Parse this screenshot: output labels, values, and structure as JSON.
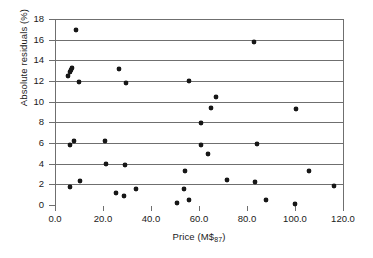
{
  "chart_data": {
    "type": "scatter",
    "title": "",
    "xlabel": "Price (M$87)",
    "xlabel_base": "Price (M$",
    "xlabel_sub": "87",
    "xlabel_tail": ")",
    "ylabel": "Absolute residuals (%)",
    "xlim": [
      0,
      120
    ],
    "ylim": [
      0,
      18
    ],
    "xticks": [
      0,
      20,
      40,
      60,
      80,
      100,
      120
    ],
    "xtick_labels": [
      "0.0",
      "20.0",
      "40.0",
      "60.0",
      "80.0",
      "100.0",
      "120.0"
    ],
    "yticks": [
      0,
      2,
      4,
      6,
      8,
      10,
      12,
      14,
      16,
      18
    ],
    "ytick_labels": [
      "0",
      "2",
      "4",
      "6",
      "8",
      "10",
      "12",
      "14",
      "16",
      "18"
    ],
    "grid": "horizontal",
    "grid_color": "#6f6f6f",
    "marker_color": "#171717",
    "legend": "none",
    "points": [
      {
        "x": 5.5,
        "y": 12.5
      },
      {
        "x": 6.3,
        "y": 12.9
      },
      {
        "x": 6.8,
        "y": 13.1
      },
      {
        "x": 7.2,
        "y": 13.25
      },
      {
        "x": 6.2,
        "y": 5.8
      },
      {
        "x": 6.4,
        "y": 1.7
      },
      {
        "x": 8.9,
        "y": 16.9
      },
      {
        "x": 9.8,
        "y": 11.9
      },
      {
        "x": 7.8,
        "y": 6.2
      },
      {
        "x": 10.4,
        "y": 2.35
      },
      {
        "x": 20.8,
        "y": 6.15
      },
      {
        "x": 21.3,
        "y": 3.95
      },
      {
        "x": 26.6,
        "y": 13.2
      },
      {
        "x": 25.6,
        "y": 1.2
      },
      {
        "x": 28.8,
        "y": 0.85
      },
      {
        "x": 29.4,
        "y": 11.8
      },
      {
        "x": 29.3,
        "y": 3.9
      },
      {
        "x": 33.8,
        "y": 1.55
      },
      {
        "x": 51.0,
        "y": 0.2
      },
      {
        "x": 53.8,
        "y": 1.6
      },
      {
        "x": 54.2,
        "y": 3.3
      },
      {
        "x": 55.9,
        "y": 0.45
      },
      {
        "x": 55.8,
        "y": 12.0
      },
      {
        "x": 60.9,
        "y": 7.9
      },
      {
        "x": 61.0,
        "y": 5.8
      },
      {
        "x": 63.8,
        "y": 4.9
      },
      {
        "x": 64.8,
        "y": 9.4
      },
      {
        "x": 67.2,
        "y": 10.5
      },
      {
        "x": 71.6,
        "y": 2.4
      },
      {
        "x": 82.8,
        "y": 15.8
      },
      {
        "x": 84.0,
        "y": 5.9
      },
      {
        "x": 83.3,
        "y": 2.2
      },
      {
        "x": 87.8,
        "y": 0.45
      },
      {
        "x": 100.2,
        "y": 9.3
      },
      {
        "x": 100.1,
        "y": 0.1
      },
      {
        "x": 105.8,
        "y": 3.25
      },
      {
        "x": 116.3,
        "y": 1.8
      }
    ]
  }
}
